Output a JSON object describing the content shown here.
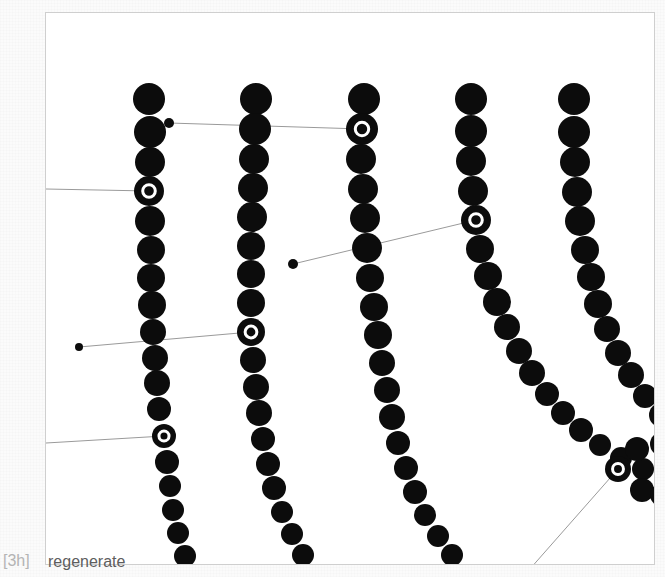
{
  "footer": {
    "step_label": "[3h]",
    "regenerate_label": "regenerate"
  },
  "canvas": {
    "background_color": "#ffffff",
    "border_color": "#cfcfcf",
    "left": 45,
    "top": 12,
    "width": 610,
    "height": 553
  },
  "style": {
    "dot_color": "#0c0c0c",
    "ring_color": "#ffffff",
    "line_color": "#9a9a9a",
    "line_width": 1
  },
  "chart_data": {
    "type": "scatter",
    "title": "",
    "subtitle": "",
    "xlabel": "",
    "ylabel": "",
    "grid": false,
    "legend": null,
    "xlim": [
      45,
      655
    ],
    "ylim": [
      12,
      565
    ],
    "series": [
      {
        "name": "strand-1",
        "points": [
          {
            "x": 148,
            "y": 98,
            "r": 16
          },
          {
            "x": 149,
            "y": 131,
            "r": 16
          },
          {
            "x": 149,
            "y": 161,
            "r": 15
          },
          {
            "x": 148,
            "y": 190,
            "r": 15,
            "highlight": true
          },
          {
            "x": 149,
            "y": 220,
            "r": 15
          },
          {
            "x": 150,
            "y": 249,
            "r": 14
          },
          {
            "x": 150,
            "y": 277,
            "r": 14
          },
          {
            "x": 151,
            "y": 304,
            "r": 14
          },
          {
            "x": 152,
            "y": 331,
            "r": 13
          },
          {
            "x": 154,
            "y": 357,
            "r": 13
          },
          {
            "x": 156,
            "y": 382,
            "r": 13
          },
          {
            "x": 158,
            "y": 408,
            "r": 12
          },
          {
            "x": 163,
            "y": 435,
            "r": 12,
            "highlight": true
          },
          {
            "x": 166,
            "y": 461,
            "r": 12
          },
          {
            "x": 169,
            "y": 485,
            "r": 11
          },
          {
            "x": 172,
            "y": 509,
            "r": 11
          },
          {
            "x": 177,
            "y": 532,
            "r": 11
          },
          {
            "x": 184,
            "y": 555,
            "r": 11
          }
        ]
      },
      {
        "name": "strand-2",
        "points": [
          {
            "x": 255,
            "y": 98,
            "r": 16
          },
          {
            "x": 254,
            "y": 128,
            "r": 16
          },
          {
            "x": 253,
            "y": 158,
            "r": 15
          },
          {
            "x": 252,
            "y": 187,
            "r": 15
          },
          {
            "x": 251,
            "y": 216,
            "r": 15
          },
          {
            "x": 250,
            "y": 245,
            "r": 14
          },
          {
            "x": 250,
            "y": 273,
            "r": 14
          },
          {
            "x": 250,
            "y": 302,
            "r": 14
          },
          {
            "x": 250,
            "y": 331,
            "r": 14,
            "highlight": true
          },
          {
            "x": 252,
            "y": 359,
            "r": 13
          },
          {
            "x": 255,
            "y": 386,
            "r": 13
          },
          {
            "x": 258,
            "y": 412,
            "r": 13
          },
          {
            "x": 262,
            "y": 438,
            "r": 12
          },
          {
            "x": 267,
            "y": 463,
            "r": 12
          },
          {
            "x": 273,
            "y": 487,
            "r": 12
          },
          {
            "x": 281,
            "y": 511,
            "r": 11
          },
          {
            "x": 291,
            "y": 533,
            "r": 11
          },
          {
            "x": 302,
            "y": 554,
            "r": 11
          }
        ]
      },
      {
        "name": "strand-3",
        "points": [
          {
            "x": 363,
            "y": 98,
            "r": 16
          },
          {
            "x": 361,
            "y": 128,
            "r": 16,
            "highlight": true
          },
          {
            "x": 360,
            "y": 158,
            "r": 15
          },
          {
            "x": 362,
            "y": 188,
            "r": 15
          },
          {
            "x": 364,
            "y": 217,
            "r": 15
          },
          {
            "x": 366,
            "y": 247,
            "r": 15
          },
          {
            "x": 369,
            "y": 277,
            "r": 14
          },
          {
            "x": 373,
            "y": 306,
            "r": 14
          },
          {
            "x": 377,
            "y": 334,
            "r": 14
          },
          {
            "x": 381,
            "y": 362,
            "r": 13
          },
          {
            "x": 386,
            "y": 389,
            "r": 13
          },
          {
            "x": 391,
            "y": 416,
            "r": 13
          },
          {
            "x": 397,
            "y": 442,
            "r": 12
          },
          {
            "x": 405,
            "y": 467,
            "r": 12
          },
          {
            "x": 414,
            "y": 491,
            "r": 12
          },
          {
            "x": 424,
            "y": 514,
            "r": 11
          },
          {
            "x": 437,
            "y": 535,
            "r": 11
          },
          {
            "x": 451,
            "y": 554,
            "r": 11
          }
        ]
      },
      {
        "name": "strand-4",
        "points": [
          {
            "x": 470,
            "y": 98,
            "r": 16
          },
          {
            "x": 470,
            "y": 130,
            "r": 16
          },
          {
            "x": 470,
            "y": 160,
            "r": 15
          },
          {
            "x": 472,
            "y": 190,
            "r": 15
          },
          {
            "x": 475,
            "y": 219,
            "r": 15,
            "highlight": true
          },
          {
            "x": 479,
            "y": 248,
            "r": 14
          },
          {
            "x": 487,
            "y": 275,
            "r": 14
          },
          {
            "x": 496,
            "y": 301,
            "r": 14
          },
          {
            "x": 506,
            "y": 326,
            "r": 13
          },
          {
            "x": 518,
            "y": 350,
            "r": 13
          },
          {
            "x": 531,
            "y": 372,
            "r": 13
          },
          {
            "x": 546,
            "y": 393,
            "r": 12
          },
          {
            "x": 562,
            "y": 412,
            "r": 12
          },
          {
            "x": 580,
            "y": 429,
            "r": 12
          },
          {
            "x": 599,
            "y": 444,
            "r": 11
          },
          {
            "x": 620,
            "y": 457,
            "r": 11
          },
          {
            "x": 642,
            "y": 468,
            "r": 11
          }
        ]
      },
      {
        "name": "strand-5",
        "points": [
          {
            "x": 573,
            "y": 98,
            "r": 16
          },
          {
            "x": 573,
            "y": 131,
            "r": 16
          },
          {
            "x": 574,
            "y": 161,
            "r": 15
          },
          {
            "x": 576,
            "y": 191,
            "r": 15
          },
          {
            "x": 579,
            "y": 220,
            "r": 15
          },
          {
            "x": 584,
            "y": 249,
            "r": 14
          },
          {
            "x": 590,
            "y": 276,
            "r": 14
          },
          {
            "x": 597,
            "y": 303,
            "r": 14
          },
          {
            "x": 606,
            "y": 328,
            "r": 13
          },
          {
            "x": 617,
            "y": 352,
            "r": 13
          },
          {
            "x": 630,
            "y": 374,
            "r": 13
          },
          {
            "x": 644,
            "y": 395,
            "r": 12
          },
          {
            "x": 660,
            "y": 414,
            "r": 12
          }
        ]
      },
      {
        "name": "strand-6-partial",
        "points": [
          {
            "x": 636,
            "y": 448,
            "r": 12
          },
          {
            "x": 617,
            "y": 468,
            "r": 13,
            "highlight": true
          },
          {
            "x": 641,
            "y": 489,
            "r": 12
          },
          {
            "x": 661,
            "y": 443,
            "r": 12
          },
          {
            "x": 660,
            "y": 494,
            "r": 11
          }
        ]
      }
    ],
    "connectors": [
      {
        "name": "connector-edge-to-strand1-upper",
        "path": [
          [
            45,
            188
          ],
          [
            148,
            190
          ]
        ],
        "start_marker": "none",
        "end_marker": "ringed-dot"
      },
      {
        "name": "connector-smalldot-to-strand3",
        "path": [
          [
            168,
            122
          ],
          [
            361,
            128
          ]
        ],
        "start_marker": "small-dot",
        "end_marker": "ringed-dot"
      },
      {
        "name": "connector-smalldot-to-strand2",
        "path": [
          [
            78,
            346
          ],
          [
            250,
            331
          ]
        ],
        "start_marker": "small-dot",
        "end_marker": "ringed-dot"
      },
      {
        "name": "connector-smalldot-to-strand4",
        "path": [
          [
            292,
            263
          ],
          [
            475,
            219
          ]
        ],
        "start_marker": "small-dot",
        "end_marker": "ringed-dot"
      },
      {
        "name": "connector-edge-to-strand1-lower",
        "path": [
          [
            45,
            442
          ],
          [
            163,
            435
          ]
        ],
        "start_marker": "none",
        "end_marker": "ringed-dot"
      },
      {
        "name": "connector-strand6-to-bottom",
        "path": [
          [
            617,
            468
          ],
          [
            521,
            577
          ]
        ],
        "start_marker": "ringed-dot",
        "end_marker": "none"
      }
    ],
    "small_dots": [
      {
        "x": 168,
        "y": 122,
        "r": 5
      },
      {
        "x": 78,
        "y": 346,
        "r": 4
      },
      {
        "x": 292,
        "y": 263,
        "r": 5
      }
    ]
  }
}
